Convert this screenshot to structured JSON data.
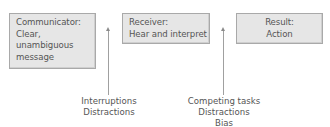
{
  "diagram": {
    "boxes": [
      {
        "id": "communicator",
        "lines": [
          "Communicator:",
          "Clear,",
          "unambiguous",
          "message"
        ]
      },
      {
        "id": "receiver",
        "lines": [
          "Receiver:",
          "Hear and interpret"
        ]
      },
      {
        "id": "result",
        "lines": [
          "Result:",
          "Action"
        ]
      }
    ],
    "barriers": [
      {
        "id": "barrier-1",
        "lines": [
          "Interruptions",
          "Distractions"
        ]
      },
      {
        "id": "barrier-2",
        "lines": [
          "Competing tasks",
          "Distractions",
          "Bias"
        ]
      }
    ],
    "colors": {
      "box_fill": "#e6e6e6",
      "box_border": "#a9a9a9",
      "text": "#555555",
      "arrow": "#a0a0a0"
    }
  }
}
